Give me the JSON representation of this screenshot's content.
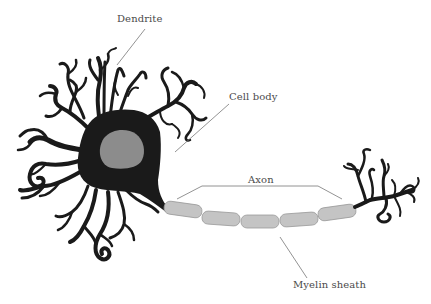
{
  "diagram": {
    "labels": {
      "dendrite": "Dendrite",
      "cell_body": "Cell body",
      "axon": "Axon",
      "myelin_sheath": "Myelin sheath"
    },
    "colors": {
      "neuron_body": "#1a1a1a",
      "nucleus": "#8c8c8c",
      "myelin": "#c4c4c4",
      "myelin_stroke": "#9a9a9a",
      "leader_line": "#777777",
      "label_text": "#4a4a4a",
      "background": "#ffffff"
    },
    "myelin_segment_count": 5
  }
}
